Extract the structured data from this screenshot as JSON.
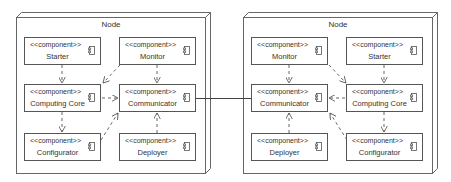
{
  "diagram": {
    "type": "UML deployment diagram",
    "nodes": [
      {
        "id": "left",
        "title": "Node",
        "components": [
          {
            "id": "starter",
            "stereotype": "<<component>>",
            "name": "Starter",
            "x": 24,
            "y": 37
          },
          {
            "id": "monitor",
            "stereotype": "<<component>>",
            "name": "Monitor",
            "x": 119,
            "y": 37
          },
          {
            "id": "computing-core",
            "stereotype": "<<component>>",
            "name": "Computing Core",
            "x": 24,
            "y": 84
          },
          {
            "id": "communicator",
            "stereotype": "<<component>>",
            "name": "Communicator",
            "x": 119,
            "y": 84
          },
          {
            "id": "configurator",
            "stereotype": "<<component>>",
            "name": "Configurator",
            "x": 24,
            "y": 133
          },
          {
            "id": "deployer",
            "stereotype": "<<component>>",
            "name": "Deployer",
            "x": 119,
            "y": 133
          }
        ]
      },
      {
        "id": "right",
        "title": "Node",
        "components": [
          {
            "id": "monitor",
            "stereotype": "<<component>>",
            "name": "Monitor",
            "x": 251,
            "y": 37
          },
          {
            "id": "starter",
            "stereotype": "<<component>>",
            "name": "Starter",
            "x": 346,
            "y": 37
          },
          {
            "id": "communicator",
            "stereotype": "<<component>>",
            "name": "Communicator",
            "x": 251,
            "y": 84
          },
          {
            "id": "computing-core",
            "stereotype": "<<component>>",
            "name": "Computing Core",
            "x": 346,
            "y": 84
          },
          {
            "id": "deployer",
            "stereotype": "<<component>>",
            "name": "Deployer",
            "x": 251,
            "y": 133
          },
          {
            "id": "configurator",
            "stereotype": "<<component>>",
            "name": "Configurator",
            "x": 346,
            "y": 133
          }
        ]
      }
    ],
    "dependencies": [
      {
        "node": "left",
        "from": "Starter",
        "to": "Computing Core"
      },
      {
        "node": "left",
        "from": "Monitor",
        "to": "Computing Core"
      },
      {
        "node": "left",
        "from": "Monitor",
        "to": "Communicator"
      },
      {
        "node": "left",
        "from": "Computing Core",
        "to": "Communicator"
      },
      {
        "node": "left",
        "from": "Computing Core",
        "to": "Configurator"
      },
      {
        "node": "left",
        "from": "Configurator",
        "to": "Communicator"
      },
      {
        "node": "left",
        "from": "Deployer",
        "to": "Communicator"
      },
      {
        "node": "right",
        "from": "Monitor",
        "to": "Communicator"
      },
      {
        "node": "right",
        "from": "Monitor",
        "to": "Computing Core"
      },
      {
        "node": "right",
        "from": "Starter",
        "to": "Computing Core"
      },
      {
        "node": "right",
        "from": "Computing Core",
        "to": "Communicator"
      },
      {
        "node": "right",
        "from": "Computing Core",
        "to": "Configurator"
      },
      {
        "node": "right",
        "from": "Configurator",
        "to": "Communicator"
      },
      {
        "node": "right",
        "from": "Deployer",
        "to": "Communicator"
      }
    ],
    "links": [
      {
        "from": "left.Communicator",
        "to": "right.Communicator",
        "style": "solid"
      }
    ],
    "colors": {
      "line": "#555555",
      "text": "#333333",
      "background": "#ffffff"
    }
  }
}
